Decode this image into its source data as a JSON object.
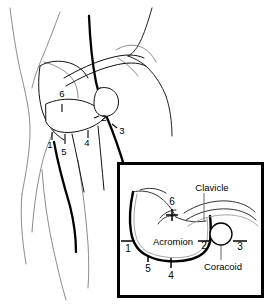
{
  "figure": {
    "background_color": "#ffffff"
  },
  "main_view": {
    "name": "posterior-shoulder-anatomy",
    "portal_numbers": [
      {
        "id": "1",
        "label": "1",
        "x": 50,
        "y": 148
      },
      {
        "id": "2",
        "label": "2",
        "x": 104,
        "y": 121
      },
      {
        "id": "3",
        "label": "3",
        "x": 122,
        "y": 134
      },
      {
        "id": "4",
        "label": "4",
        "x": 87,
        "y": 146
      },
      {
        "id": "5",
        "label": "5",
        "x": 64,
        "y": 155
      },
      {
        "id": "6",
        "label": "6",
        "x": 62,
        "y": 97
      }
    ]
  },
  "inset_view": {
    "name": "enlarged-bony-landmarks",
    "frame": {
      "x": 117,
      "y": 162,
      "width": 147,
      "height": 136
    },
    "anatomy_labels": [
      {
        "id": "clavicle",
        "label": "Clavicle",
        "x": 190,
        "y": 188
      },
      {
        "id": "acromion",
        "label": "Acromion",
        "x": 147,
        "y": 244
      },
      {
        "id": "coracoid",
        "label": "Coracoid",
        "x": 203,
        "y": 268
      }
    ],
    "portal_numbers": [
      {
        "id": "1",
        "label": "1",
        "x": 128,
        "y": 252
      },
      {
        "id": "2",
        "label": "2",
        "x": 204,
        "y": 249
      },
      {
        "id": "3",
        "label": "3",
        "x": 240,
        "y": 250
      },
      {
        "id": "4",
        "label": "4",
        "x": 171,
        "y": 274
      },
      {
        "id": "5",
        "label": "5",
        "x": 148,
        "y": 268
      },
      {
        "id": "6",
        "label": "6",
        "x": 172,
        "y": 205
      }
    ]
  },
  "colors": {
    "outline": "#6e6e6e",
    "bone": "#111111",
    "heavy": "#000000",
    "frame": "#000000"
  }
}
